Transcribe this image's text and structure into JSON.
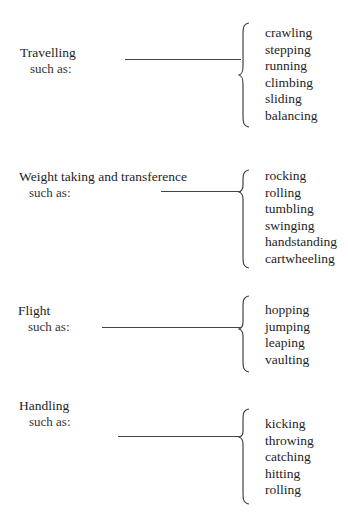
{
  "sections": [
    {
      "title": "Travelling",
      "subtitle": "such as:",
      "items": [
        "crawling",
        "stepping",
        "running",
        "climbing",
        "sliding",
        "balancing"
      ]
    },
    {
      "title": "Weight taking and transference",
      "subtitle": "such as:",
      "items": [
        "rocking",
        "rolling",
        "tumbling",
        "swinging",
        "handstanding",
        "cartwheeling"
      ]
    },
    {
      "title": "Flight",
      "subtitle": "such as:",
      "items": [
        "hopping",
        "jumping",
        "leaping",
        "vaulting"
      ]
    },
    {
      "title": "Handling",
      "subtitle": "such as:",
      "items": [
        "kicking",
        "throwing",
        "catching",
        "hitting",
        "rolling"
      ]
    }
  ]
}
